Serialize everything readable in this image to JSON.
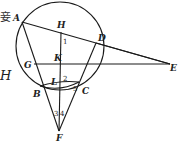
{
  "diagram": {
    "type": "geometry",
    "fragments": {
      "left_char": "妾",
      "left_letter": "H"
    },
    "circle": {
      "cx": 60,
      "cy": 46,
      "r": 44
    },
    "points": {
      "A": {
        "label": "A",
        "x": 22,
        "y": 22
      },
      "H": {
        "label": "H",
        "x": 61,
        "y": 32
      },
      "D": {
        "label": "D",
        "x": 96,
        "y": 43
      },
      "E": {
        "label": "E",
        "x": 170,
        "y": 64
      },
      "G": {
        "label": "G",
        "x": 34,
        "y": 64
      },
      "K": {
        "label": "K",
        "x": 61,
        "y": 64
      },
      "B": {
        "label": "B",
        "x": 40,
        "y": 86
      },
      "L": {
        "label": "L",
        "x": 60,
        "y": 84
      },
      "C": {
        "label": "C",
        "x": 79,
        "y": 82
      },
      "F": {
        "label": "F",
        "x": 59,
        "y": 131
      }
    },
    "angles": {
      "a1": "1",
      "a2": "2",
      "a3": "3",
      "a4": "4",
      "a5": "5"
    },
    "segments": [
      "A-E",
      "D-E",
      "G-E",
      "A-B",
      "B-F",
      "D-C",
      "C-F",
      "H-F",
      "B-C"
    ]
  }
}
